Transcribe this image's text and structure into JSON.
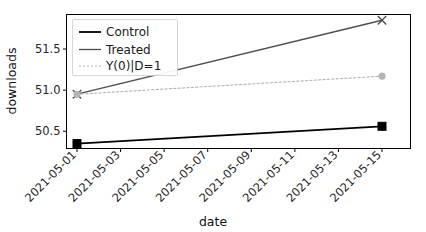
{
  "chart_data": {
    "type": "line",
    "title": "",
    "xlabel": "date",
    "ylabel": "downloads",
    "grid": false,
    "legend_position": "upper left",
    "x": [
      "2021-05-01",
      "2021-05-15"
    ],
    "xticklabels": [
      "2021-05-01",
      "2021-05-03",
      "2021-05-05",
      "2021-05-07",
      "2021-05-09",
      "2021-05-11",
      "2021-05-13",
      "2021-05-15"
    ],
    "yticklabels": [
      "50.5",
      "51.0",
      "51.5"
    ],
    "ytickvalues": [
      50.5,
      51.0,
      51.5
    ],
    "ylim": [
      50.29,
      51.92
    ],
    "xlim": [
      "2021-04-30",
      "2021-05-16"
    ],
    "series": [
      {
        "name": "Control",
        "values": [
          50.35,
          50.56
        ],
        "color": "#000000",
        "linestyle": "solid",
        "marker": "square",
        "linewidth": 1.8
      },
      {
        "name": "Treated",
        "values": [
          50.95,
          51.85
        ],
        "color": "#4d4d4d",
        "linestyle": "solid",
        "marker": "x",
        "linewidth": 1.3
      },
      {
        "name": "Y(0)|D=1",
        "values": [
          50.95,
          51.17
        ],
        "color": "#b3b3b3",
        "linestyle": "dotted",
        "marker": "circle",
        "linewidth": 1.1
      }
    ]
  },
  "legend": {
    "entries": [
      {
        "label": "Control"
      },
      {
        "label": "Treated"
      },
      {
        "label": "Y(0)|D=1"
      }
    ]
  },
  "axes": {
    "xlabel": "date",
    "ylabel": "downloads"
  }
}
